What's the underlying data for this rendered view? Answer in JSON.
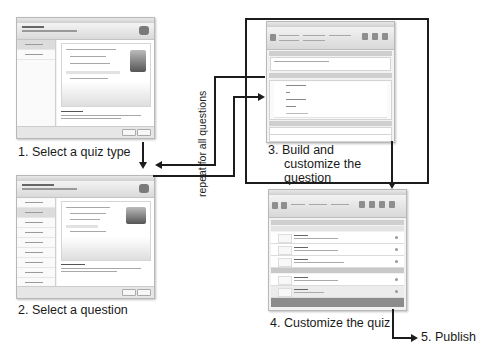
{
  "diagram": {
    "steps": [
      {
        "id": 1,
        "label": "1. Select a quiz type",
        "screenshot": "quiz-type-wizard"
      },
      {
        "id": 2,
        "label": "2. Select a question",
        "screenshot": "question-type-wizard"
      },
      {
        "id": 3,
        "label_lines": [
          "3. Build and",
          "customize the",
          "question"
        ],
        "screenshot": "question-editor"
      },
      {
        "id": 4,
        "label": "4. Customize the quiz",
        "screenshot": "quiz-editor"
      },
      {
        "id": 5,
        "label": "5. Publish"
      }
    ],
    "loop_label": "repeat for all questions",
    "flow": [
      "1 -> 2",
      "2 -> 3",
      "3 -> 2 (repeat)",
      "3 -> 4",
      "4 -> 5"
    ],
    "colors": {
      "lines": "#1c1c1c",
      "screenshot_bg": "#f2f2f2",
      "screenshot_border": "#b8b8b8"
    }
  }
}
